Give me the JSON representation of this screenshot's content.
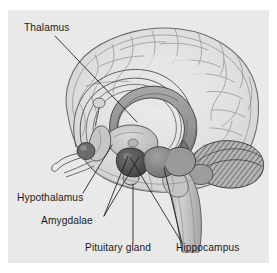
{
  "figure": {
    "kind": "anatomical-illustration",
    "background_color": "#e9e9e9",
    "page_color": "#ffffff",
    "line_color": "#1b1b1b"
  },
  "labels": [
    {
      "id": "thalamus",
      "text": "Thalamus",
      "x": 24,
      "y": 31,
      "anchor": "start",
      "points_to": "thalamus-body"
    },
    {
      "id": "hypothalamus",
      "text": "Hypothalamus",
      "x": 17,
      "y": 201,
      "anchor": "start",
      "points_to": "hypothalamus-body"
    },
    {
      "id": "amygdalae",
      "text": "Amygdalae",
      "x": 41,
      "y": 224,
      "anchor": "start",
      "points_to": "amygdala-body"
    },
    {
      "id": "pituitary-gland",
      "text": "Pituitary gland",
      "x": 85,
      "y": 251,
      "anchor": "start",
      "points_to": "pituitary-body"
    },
    {
      "id": "hippocampus",
      "text": "Hippocampus",
      "x": 176,
      "y": 251,
      "anchor": "start",
      "points_to": "hippocampus-body"
    }
  ],
  "structures": [
    {
      "id": "cerebral-cortex",
      "name": "Cerebral cortex",
      "fill": "#dedede"
    },
    {
      "id": "fornix",
      "name": "Fornix",
      "fill": "#cfcfcf"
    },
    {
      "id": "corpus-callosum",
      "name": "Corpus callosum",
      "fill": "#9a9a9a"
    },
    {
      "id": "thalamus-body",
      "name": "Thalamus",
      "fill": "#c9c9c9"
    },
    {
      "id": "hypothalamus-body",
      "name": "Hypothalamus",
      "fill": "#b9b9b9"
    },
    {
      "id": "amygdala-body",
      "name": "Amygdala",
      "fill": "#5e5e5e"
    },
    {
      "id": "hippocampus-body",
      "name": "Hippocampus",
      "fill": "#8a8a8a"
    },
    {
      "id": "pituitary-body",
      "name": "Pituitary gland",
      "fill": "#c4c4c4"
    },
    {
      "id": "mammillary-body",
      "name": "Mammillary body",
      "fill": "#707070"
    },
    {
      "id": "cerebellum",
      "name": "Cerebellum",
      "fill": "#b0b0b0"
    },
    {
      "id": "brain-stem",
      "name": "Brain stem",
      "fill": "#c8c8c8"
    },
    {
      "id": "olfactory-bulb",
      "name": "Olfactory bulb",
      "fill": "#d2d2d2"
    }
  ]
}
